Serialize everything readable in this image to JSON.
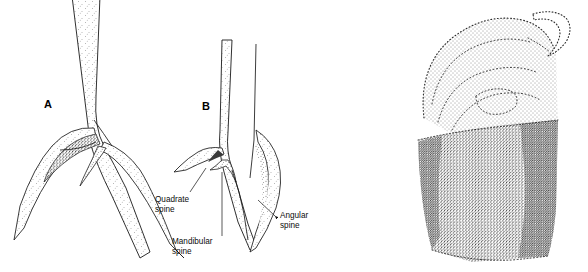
{
  "figure": {
    "background_color": "#ffffff",
    "ink_color": "#1a1a1a",
    "text_color": "#0d0d0d",
    "type": "scientific-line-illustration",
    "technique": "stipple-shading"
  },
  "panels": [
    {
      "id": "A",
      "letter": "A",
      "description": "Mandible tip, lateral view, with overlapping curved spines"
    },
    {
      "id": "B",
      "letter": "B",
      "description": "Mandible tip, narrower shaft, with quadrate, mandibular and angular spines"
    },
    {
      "id": "C",
      "letter": "",
      "description": "Stippled anatomical structure with apical hook and dark shaded base"
    }
  ],
  "labels": [
    {
      "id": "quadrate",
      "line1": "Quadrate",
      "line2": "spine"
    },
    {
      "id": "mandibular",
      "line1": "Mandibular",
      "line2": "spine"
    },
    {
      "id": "angular",
      "line1": "Angular",
      "line2": "spine"
    }
  ]
}
